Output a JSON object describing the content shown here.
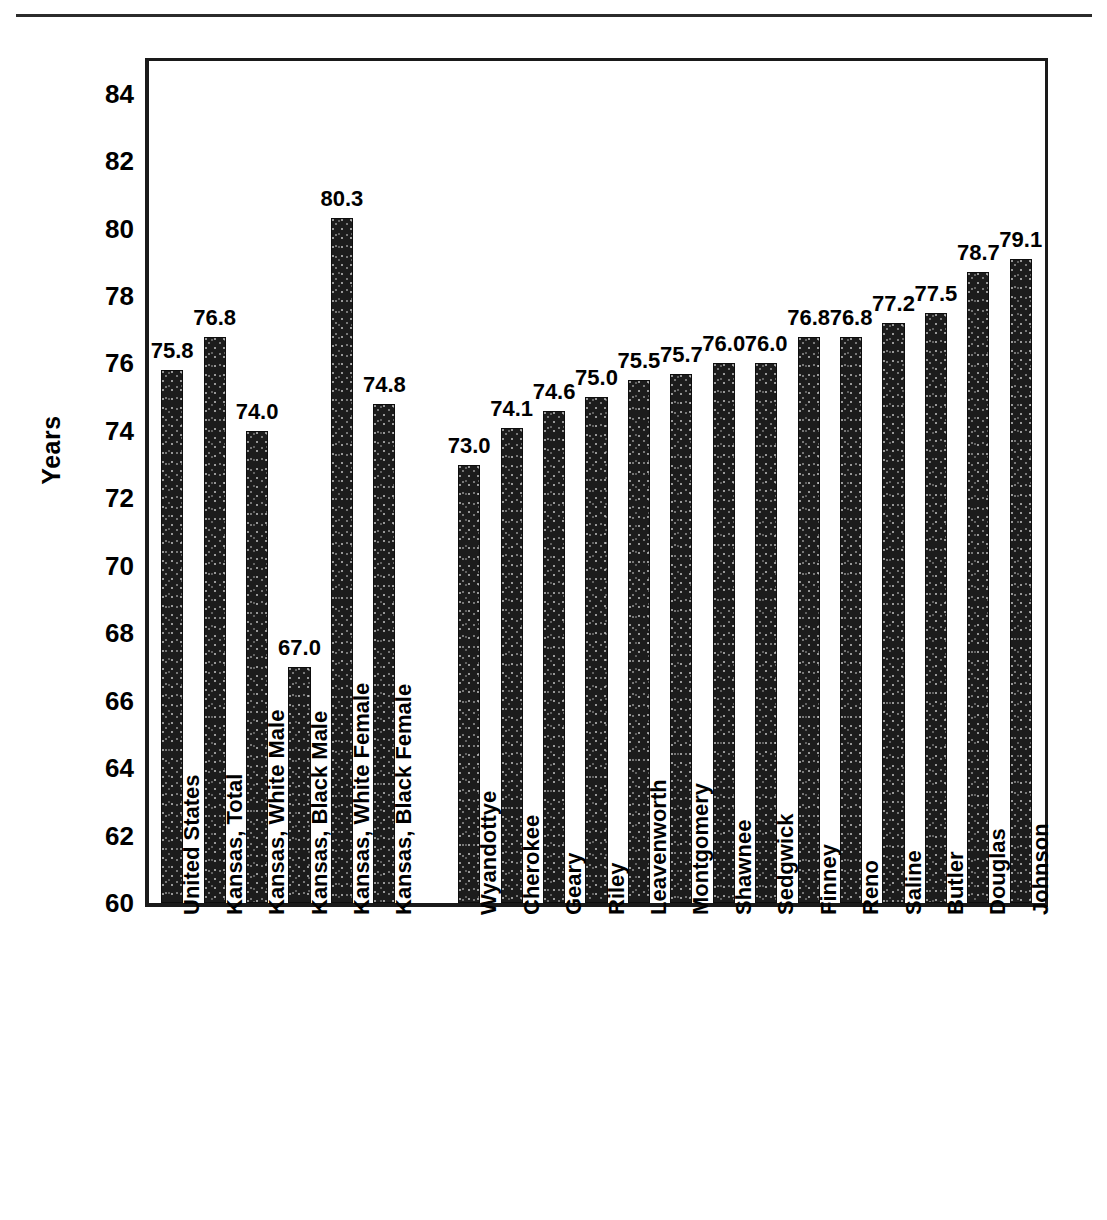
{
  "chart_data": {
    "type": "bar",
    "title": "",
    "xlabel": "",
    "ylabel": "Years",
    "ylim": [
      60,
      85
    ],
    "yticks": [
      60,
      62,
      64,
      66,
      68,
      70,
      72,
      74,
      76,
      78,
      80,
      82,
      84
    ],
    "grid": false,
    "legend": null,
    "categories": [
      "United States",
      "Kansas, Total",
      "Kansas, White Male",
      "Kansas, Black Male",
      "Kansas, White Female",
      "Kansas, Black Female",
      "Wyandottye",
      "Cherokee",
      "Geary",
      "Riley",
      "Leavenworth",
      "Montgomery",
      "Shawnee",
      "Sedgwick",
      "Finney",
      "Reno",
      "Saline",
      "Butler",
      "Douglas",
      "Johnson"
    ],
    "values": [
      75.8,
      76.8,
      74.0,
      67.0,
      80.3,
      74.8,
      73.0,
      74.1,
      74.6,
      75.0,
      75.5,
      75.7,
      76.0,
      76.0,
      76.8,
      76.8,
      77.2,
      77.5,
      78.7,
      79.1
    ],
    "value_labels": [
      "75.8",
      "76.8",
      "74.0",
      "67.0",
      "80.3",
      "74.8",
      "73.0",
      "74.1",
      "74.6",
      "75.0",
      "75.5",
      "75.7",
      "76.0",
      "76.0",
      "76.8",
      "76.8",
      "77.2",
      "77.5",
      "78.7",
      "79.1"
    ],
    "group_break_after_index": 5,
    "bar_color": "#1c1c1c"
  }
}
